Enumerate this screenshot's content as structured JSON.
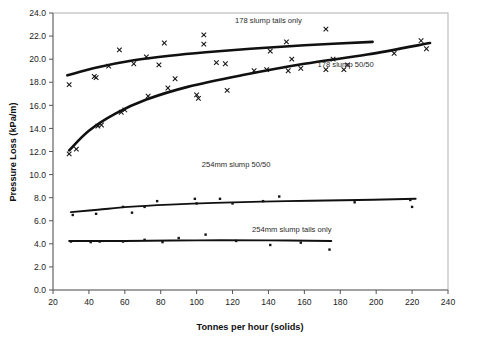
{
  "chart_data": {
    "type": "scatter",
    "title": "",
    "xlabel": "Tonnes per hour  (solids)",
    "ylabel": "Pressure Loss (kPa/m)",
    "xlim": [
      20,
      240
    ],
    "ylim": [
      0.0,
      24.0
    ],
    "xticks": [
      20,
      40,
      60,
      80,
      100,
      120,
      140,
      160,
      180,
      200,
      220,
      240
    ],
    "yticks": [
      0.0,
      2.0,
      4.0,
      6.0,
      8.0,
      10.0,
      12.0,
      14.0,
      16.0,
      18.0,
      20.0,
      22.0,
      24.0
    ],
    "xtick_labels": [
      "20",
      "40",
      "60",
      "80",
      "100",
      "120",
      "140",
      "160",
      "180",
      "200",
      "220",
      "240"
    ],
    "ytick_labels": [
      "0.0",
      "2.0",
      "4.0",
      "6.0",
      "8.0",
      "10.0",
      "12.0",
      "14.0",
      "16.0",
      "18.0",
      "20.0",
      "22.0",
      "24.0"
    ],
    "grid": false,
    "legend_position": "inline-annotations",
    "series": [
      {
        "name": "178 slump tails only",
        "marker": "x",
        "label_x": 140,
        "label_y": 23.1,
        "points": [
          {
            "x": 29,
            "y": 17.8
          },
          {
            "x": 43,
            "y": 18.5
          },
          {
            "x": 44,
            "y": 18.4
          },
          {
            "x": 51,
            "y": 19.4
          },
          {
            "x": 57,
            "y": 20.8
          },
          {
            "x": 65,
            "y": 19.6
          },
          {
            "x": 72,
            "y": 20.2
          },
          {
            "x": 79,
            "y": 19.5
          },
          {
            "x": 82,
            "y": 21.4
          },
          {
            "x": 88,
            "y": 18.3
          },
          {
            "x": 104,
            "y": 22.1
          },
          {
            "x": 104,
            "y": 21.3
          },
          {
            "x": 111,
            "y": 19.7
          },
          {
            "x": 116,
            "y": 19.6
          },
          {
            "x": 141,
            "y": 20.7
          },
          {
            "x": 150,
            "y": 21.5
          },
          {
            "x": 153,
            "y": 20.0
          },
          {
            "x": 172,
            "y": 22.6
          },
          {
            "x": 176,
            "y": 20.0
          },
          {
            "x": 182,
            "y": 19.1
          }
        ],
        "fit": [
          {
            "x": 28,
            "y": 18.6
          },
          {
            "x": 45,
            "y": 19.3
          },
          {
            "x": 65,
            "y": 19.9
          },
          {
            "x": 85,
            "y": 20.3
          },
          {
            "x": 105,
            "y": 20.6
          },
          {
            "x": 130,
            "y": 20.9
          },
          {
            "x": 160,
            "y": 21.2
          },
          {
            "x": 198,
            "y": 21.5
          }
        ]
      },
      {
        "name": "178 slump 50/50",
        "marker": "x",
        "label_x": 183,
        "label_y": 19.3,
        "points": [
          {
            "x": 29,
            "y": 11.8
          },
          {
            "x": 33,
            "y": 12.2
          },
          {
            "x": 45,
            "y": 14.2
          },
          {
            "x": 47,
            "y": 14.3
          },
          {
            "x": 58,
            "y": 15.4
          },
          {
            "x": 60,
            "y": 15.6
          },
          {
            "x": 73,
            "y": 16.8
          },
          {
            "x": 84,
            "y": 17.5
          },
          {
            "x": 100,
            "y": 16.9
          },
          {
            "x": 101,
            "y": 16.6
          },
          {
            "x": 117,
            "y": 17.3
          },
          {
            "x": 132,
            "y": 19.0
          },
          {
            "x": 139,
            "y": 19.1
          },
          {
            "x": 151,
            "y": 19.0
          },
          {
            "x": 158,
            "y": 19.2
          },
          {
            "x": 172,
            "y": 19.1
          },
          {
            "x": 184,
            "y": 19.5
          },
          {
            "x": 210,
            "y": 20.5
          },
          {
            "x": 225,
            "y": 21.6
          },
          {
            "x": 228,
            "y": 20.9
          }
        ],
        "fit": [
          {
            "x": 29,
            "y": 12.1
          },
          {
            "x": 40,
            "y": 13.8
          },
          {
            "x": 55,
            "y": 15.3
          },
          {
            "x": 72,
            "y": 16.5
          },
          {
            "x": 95,
            "y": 17.6
          },
          {
            "x": 125,
            "y": 18.6
          },
          {
            "x": 160,
            "y": 19.6
          },
          {
            "x": 195,
            "y": 20.4
          },
          {
            "x": 230,
            "y": 21.4
          }
        ]
      },
      {
        "name": "254mm slump 50/50",
        "marker": "dot",
        "label_x": 122,
        "label_y": 10.7,
        "points": [
          {
            "x": 31,
            "y": 6.5
          },
          {
            "x": 44,
            "y": 6.6
          },
          {
            "x": 59,
            "y": 7.2
          },
          {
            "x": 64,
            "y": 6.7
          },
          {
            "x": 71,
            "y": 7.2
          },
          {
            "x": 78,
            "y": 7.7
          },
          {
            "x": 99,
            "y": 7.9
          },
          {
            "x": 100,
            "y": 7.5
          },
          {
            "x": 113,
            "y": 7.9
          },
          {
            "x": 120,
            "y": 7.5
          },
          {
            "x": 137,
            "y": 7.7
          },
          {
            "x": 146,
            "y": 8.1
          },
          {
            "x": 188,
            "y": 7.6
          },
          {
            "x": 219,
            "y": 7.8
          },
          {
            "x": 220,
            "y": 7.2
          }
        ],
        "fit": [
          {
            "x": 30,
            "y": 6.75
          },
          {
            "x": 45,
            "y": 6.95
          },
          {
            "x": 62,
            "y": 7.2
          },
          {
            "x": 85,
            "y": 7.4
          },
          {
            "x": 110,
            "y": 7.55
          },
          {
            "x": 150,
            "y": 7.7
          },
          {
            "x": 190,
            "y": 7.8
          },
          {
            "x": 222,
            "y": 7.9
          }
        ]
      },
      {
        "name": "254mm slump tails only",
        "marker": "dot",
        "label_x": 153,
        "label_y": 5.0,
        "points": [
          {
            "x": 30,
            "y": 4.2
          },
          {
            "x": 41,
            "y": 4.15
          },
          {
            "x": 46,
            "y": 4.2
          },
          {
            "x": 59,
            "y": 4.2
          },
          {
            "x": 71,
            "y": 4.35
          },
          {
            "x": 81,
            "y": 4.15
          },
          {
            "x": 90,
            "y": 4.5
          },
          {
            "x": 105,
            "y": 4.8
          },
          {
            "x": 122,
            "y": 4.25
          },
          {
            "x": 141,
            "y": 3.9
          },
          {
            "x": 158,
            "y": 4.1
          },
          {
            "x": 174,
            "y": 3.5
          }
        ],
        "fit": [
          {
            "x": 29,
            "y": 4.25
          },
          {
            "x": 60,
            "y": 4.25
          },
          {
            "x": 100,
            "y": 4.3
          },
          {
            "x": 140,
            "y": 4.3
          },
          {
            "x": 175,
            "y": 4.25
          }
        ]
      }
    ]
  }
}
